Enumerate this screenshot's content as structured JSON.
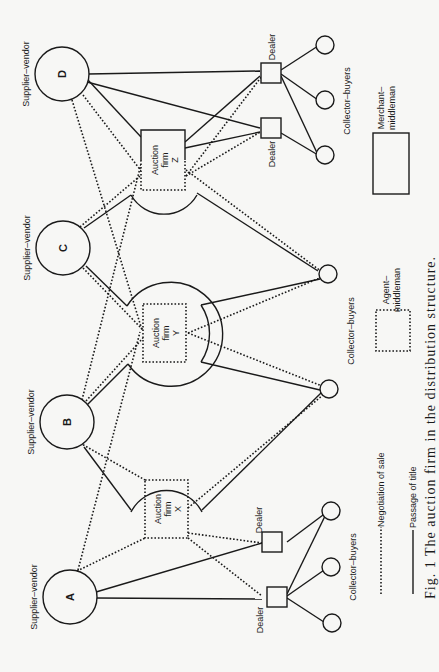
{
  "diagram": {
    "orientation": "rotated-90-ccw",
    "suppliers": [
      {
        "id": "A",
        "label": "Supplier–vendor"
      },
      {
        "id": "B",
        "label": "Supplier–vendor"
      },
      {
        "id": "C",
        "label": "Supplier–vendor"
      },
      {
        "id": "D",
        "label": "Supplier–vendor"
      }
    ],
    "auction_firms": [
      {
        "line1": "Auction",
        "line2": "firm",
        "id": "X"
      },
      {
        "line1": "Auction",
        "line2": "firm",
        "id": "Y"
      },
      {
        "line1": "Auction",
        "line2": "firm",
        "id": "Z"
      }
    ],
    "dealer_label": "Dealer",
    "collector_label": "Collector–buyers",
    "legend": {
      "negotiation": "Negotiation of sale",
      "passage": "Passage of title",
      "agent_line1": "Agent–",
      "agent_line2": "middleman",
      "merchant_line1": "Merchant–",
      "merchant_line2": "middleman"
    },
    "caption": "Fig. 1  The auction firm in the distribution structure."
  }
}
